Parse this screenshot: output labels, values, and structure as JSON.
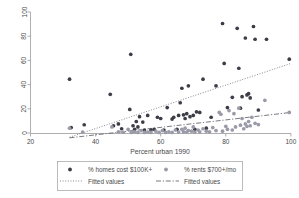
{
  "chart_data": {
    "type": "scatter",
    "title": "",
    "xlabel": "Percent urban 1990",
    "ylabel": "",
    "xlim": [
      20,
      100
    ],
    "ylim": [
      0,
      100
    ],
    "xticks": [
      20,
      40,
      60,
      80,
      100
    ],
    "yticks": [
      0,
      20,
      40,
      60,
      80,
      100
    ],
    "grid": false,
    "legend_position": "below-axis",
    "series": [
      {
        "name": "% homes cost $100K+",
        "marker": "circle",
        "color": "#3d3d47",
        "points": [
          [
            32.0,
            44.5
          ],
          [
            32.5,
            4.5
          ],
          [
            36.5,
            6.8
          ],
          [
            44.5,
            32.0
          ],
          [
            45.5,
            6.0
          ],
          [
            47.0,
            7.5
          ],
          [
            48.0,
            3.5
          ],
          [
            50.5,
            19.5
          ],
          [
            50.8,
            65.0
          ],
          [
            51.5,
            6.0
          ],
          [
            52.0,
            3.0
          ],
          [
            52.5,
            9.5
          ],
          [
            53.0,
            5.0
          ],
          [
            53.5,
            13.5
          ],
          [
            54.5,
            9.0
          ],
          [
            55.0,
            2.5
          ],
          [
            56.0,
            14.5
          ],
          [
            57.0,
            2.5
          ],
          [
            58.0,
            3.0
          ],
          [
            59.0,
            13.0
          ],
          [
            60.0,
            12.0
          ],
          [
            61.0,
            2.5
          ],
          [
            62.0,
            21.0
          ],
          [
            63.5,
            11.5
          ],
          [
            64.0,
            13.0
          ],
          [
            65.0,
            3.0
          ],
          [
            65.5,
            14.5
          ],
          [
            66.0,
            25.0
          ],
          [
            66.5,
            37.0
          ],
          [
            67.0,
            15.0
          ],
          [
            67.5,
            12.0
          ],
          [
            68.0,
            16.0
          ],
          [
            68.5,
            39.0
          ],
          [
            69.0,
            13.5
          ],
          [
            70.0,
            14.5
          ],
          [
            70.5,
            3.0
          ],
          [
            71.0,
            17.5
          ],
          [
            72.0,
            17.0
          ],
          [
            73.0,
            44.5
          ],
          [
            74.0,
            4.0
          ],
          [
            75.5,
            13.0
          ],
          [
            77.0,
            39.0
          ],
          [
            79.0,
            90.5
          ],
          [
            79.5,
            57.5
          ],
          [
            80.5,
            21.0
          ],
          [
            82.0,
            29.5
          ],
          [
            83.5,
            86.5
          ],
          [
            84.0,
            53.5
          ],
          [
            84.5,
            20.5
          ],
          [
            85.0,
            30.0
          ],
          [
            86.0,
            78.5
          ],
          [
            86.5,
            31.5
          ],
          [
            87.0,
            32.5
          ],
          [
            87.5,
            29.0
          ],
          [
            88.5,
            88.0
          ],
          [
            89.0,
            77.5
          ],
          [
            90.0,
            19.0
          ],
          [
            92.5,
            77.5
          ],
          [
            99.5,
            61.0
          ]
        ]
      },
      {
        "name": "% rents $700+/mo",
        "marker": "circle",
        "color": "#9a9aa8",
        "points": [
          [
            32.0,
            4.0
          ],
          [
            36.0,
            0.8
          ],
          [
            45.0,
            5.0
          ],
          [
            47.0,
            1.0
          ],
          [
            48.5,
            0.6
          ],
          [
            50.0,
            3.0
          ],
          [
            51.0,
            0.5
          ],
          [
            52.0,
            1.0
          ],
          [
            53.0,
            0.5
          ],
          [
            54.0,
            2.0
          ],
          [
            55.0,
            0.5
          ],
          [
            56.0,
            0.8
          ],
          [
            57.0,
            0.5
          ],
          [
            58.5,
            1.5
          ],
          [
            59.5,
            0.5
          ],
          [
            60.5,
            2.0
          ],
          [
            61.5,
            0.5
          ],
          [
            62.5,
            1.0
          ],
          [
            63.5,
            0.5
          ],
          [
            64.5,
            2.5
          ],
          [
            65.5,
            0.8
          ],
          [
            66.5,
            3.0
          ],
          [
            67.0,
            1.0
          ],
          [
            67.5,
            4.0
          ],
          [
            68.0,
            0.8
          ],
          [
            68.5,
            2.0
          ],
          [
            69.5,
            1.5
          ],
          [
            70.0,
            5.0
          ],
          [
            70.5,
            0.8
          ],
          [
            71.5,
            2.5
          ],
          [
            72.0,
            1.0
          ],
          [
            73.0,
            3.5
          ],
          [
            74.0,
            1.5
          ],
          [
            75.0,
            1.0
          ],
          [
            76.0,
            4.5
          ],
          [
            77.0,
            2.0
          ],
          [
            78.0,
            17.0
          ],
          [
            78.5,
            15.5
          ],
          [
            79.0,
            1.5
          ],
          [
            80.0,
            5.5
          ],
          [
            80.5,
            3.0
          ],
          [
            81.0,
            18.5
          ],
          [
            82.0,
            2.5
          ],
          [
            82.5,
            16.0
          ],
          [
            83.0,
            5.0
          ],
          [
            84.0,
            20.5
          ],
          [
            84.5,
            6.5
          ],
          [
            85.0,
            12.0
          ],
          [
            85.5,
            3.5
          ],
          [
            86.0,
            7.5
          ],
          [
            86.5,
            5.5
          ],
          [
            87.0,
            9.5
          ],
          [
            87.5,
            6.0
          ],
          [
            88.0,
            13.0
          ],
          [
            89.0,
            8.0
          ],
          [
            90.0,
            7.0
          ],
          [
            92.0,
            27.0
          ],
          [
            99.5,
            17.0
          ]
        ]
      }
    ],
    "fits": [
      {
        "name": "Fitted values",
        "style": "dotted",
        "for_series": "% homes cost $100K+",
        "x": [
          32.0,
          100.0
        ],
        "y": [
          -3.5,
          57.5
        ]
      },
      {
        "name": "Fitted values",
        "style": "dash-dot",
        "for_series": "% rents $700+/mo",
        "x": [
          32.0,
          100.0
        ],
        "y": [
          -4.0,
          17.0
        ]
      }
    ]
  },
  "axes": {
    "x_title": "Percent urban 1990",
    "x_tick_labels": [
      "20",
      "40",
      "60",
      "80",
      "100"
    ],
    "y_tick_labels": [
      "0",
      "20",
      "40",
      "60",
      "80",
      "100"
    ]
  },
  "legend": {
    "entries": [
      {
        "label": "% homes cost $100K+",
        "marker": "filled-circle-dark",
        "color": "#3d3d47"
      },
      {
        "label": "% rents $700+/mo",
        "marker": "filled-circle-grey",
        "color": "#9a9aa8"
      },
      {
        "label": "Fitted values",
        "marker": "dotted-line",
        "color": "#55555f"
      },
      {
        "label": "Fitted values",
        "marker": "dash-dot-line",
        "color": "#55555f"
      }
    ]
  }
}
